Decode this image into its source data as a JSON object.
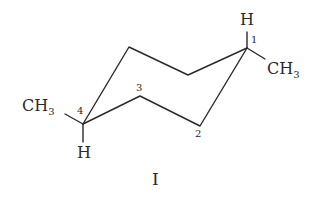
{
  "diagram": {
    "type": "chair-conformation",
    "compound_label": "I",
    "line_color": "#2a2a2a",
    "atoms": {
      "c1": {
        "label": "1",
        "substituent_up": "H",
        "substituent_side": "CH",
        "substituent_side_sub": "3"
      },
      "c2": {
        "label": "2"
      },
      "c3": {
        "label": "3"
      },
      "c4": {
        "label": "4",
        "substituent_side": "CH",
        "substituent_side_sub": "3",
        "substituent_down": "H"
      }
    }
  }
}
